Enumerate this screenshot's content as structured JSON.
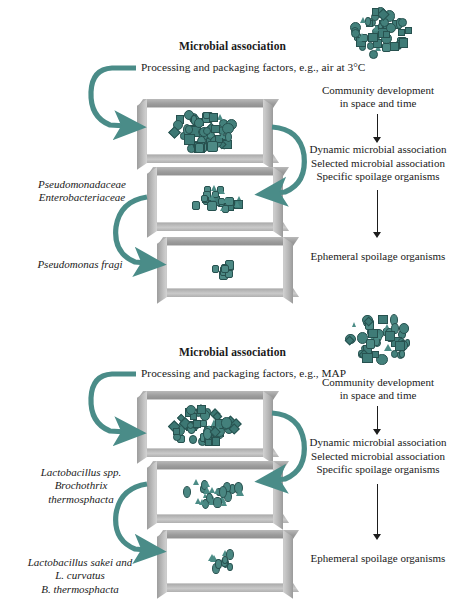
{
  "figure": {
    "panels": [
      {
        "id": "aerobic",
        "header": "Microbial association",
        "factors_line": "Processing and packaging factors, e.g., air at 3°C",
        "community_line1": "Community development",
        "community_line2": "in space and time",
        "stages": [
          "Dynamic microbial association",
          "Selected microbial association",
          "Specific spoilage organisms"
        ],
        "stages_highlighted": false,
        "outcome": "Ephemeral spoilage organisms",
        "taxa_labels": [
          {
            "lines": [
              "Pseudomonadaceae",
              "Enterobacteriaceae"
            ],
            "roman_suffix": []
          },
          {
            "lines": [
              "Pseudomonas fragi"
            ],
            "roman_suffix": []
          }
        ],
        "boxes": [
          {
            "name": "initial-association-box",
            "population": "diverse-dense"
          },
          {
            "name": "selected-association-box",
            "population": "selected-medium"
          },
          {
            "name": "specific-spoilage-box",
            "population": "specific-sparse"
          }
        ],
        "inoculum_cluster": "dense-mixed-morphotypes"
      },
      {
        "id": "map",
        "header": "Microbial association",
        "factors_line": "Processing and packaging factors, e.g., MAP",
        "community_line1": "Community development",
        "community_line2": "in space and time",
        "stages": [
          "Dynamic microbial association",
          "Selected microbial association",
          "Specific spoilage organisms"
        ],
        "stages_highlighted": true,
        "outcome": "Ephemeral spoilage organisms",
        "taxa_labels": [
          {
            "lines": [
              "Lactobacillus spp.",
              "Brochothrix",
              "thermosphacta"
            ],
            "roman_suffix": []
          },
          {
            "lines": [
              "Lactobacillus sakei and",
              "L. curvatus",
              "B. thermosphacta"
            ],
            "roman_suffix": [
              "and"
            ]
          }
        ],
        "boxes": [
          {
            "name": "initial-association-box",
            "population": "diverse-dense"
          },
          {
            "name": "selected-association-box",
            "population": "selected-medium"
          },
          {
            "name": "specific-spoilage-box",
            "population": "specific-sparse"
          }
        ],
        "inoculum_cluster": "dense-mixed-morphotypes"
      }
    ],
    "colors": {
      "teal_arrow": "#4a8c88",
      "organism_fill": "#45837e",
      "organism_stroke": "#27514f",
      "highlight_text": "#3e7d6e",
      "frame_gray": "#b3b3b3",
      "body_text": "#1a1a1a"
    }
  }
}
